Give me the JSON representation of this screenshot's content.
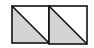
{
  "diagram": {
    "colors": {
      "background": "#ffffff",
      "stroke": "#111111",
      "fill_shaded": "#d4d4d4",
      "fill_unshaded": "#ffffff"
    },
    "squares": [
      {
        "x": 12,
        "y": 6,
        "size": 37,
        "shaded_half": "lower-left"
      },
      {
        "x": 49,
        "y": 6,
        "size": 38,
        "shaded_half": "lower-left"
      }
    ]
  }
}
